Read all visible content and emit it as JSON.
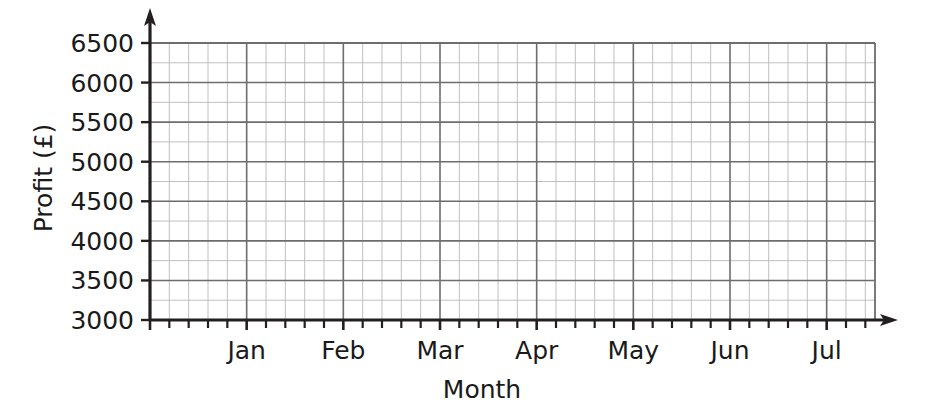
{
  "chart_data": {
    "type": "line",
    "title": "",
    "subtitle": "",
    "xlabel": "Month",
    "ylabel": "Profit (£)",
    "x_tick_labels": [
      "Jan",
      "Feb",
      "Mar",
      "Apr",
      "May",
      "Jun",
      "Jul"
    ],
    "y_tick_labels": [
      "3000",
      "3500",
      "4000",
      "4500",
      "5000",
      "5500",
      "6000",
      "6500"
    ],
    "y_tick_values": [
      3000,
      3500,
      4000,
      4500,
      5000,
      5500,
      6000,
      6500
    ],
    "ylim": [
      3000,
      6500
    ],
    "y_major_step": 500,
    "y_minor_step": 250,
    "x_minor_ticks_per_month": 5,
    "grid": true,
    "grid_minor": true,
    "legend": "none",
    "series": [],
    "values": [],
    "annotations": [],
    "note": "Empty plotting grid; no data series are drawn."
  },
  "axes": {
    "y_axis_label": "Profit (£)",
    "x_axis_label": "Month",
    "y_labels": [
      "6500",
      "6000",
      "5500",
      "5000",
      "4500",
      "4000",
      "3500",
      "3000"
    ],
    "x_labels": [
      "Jan",
      "Feb",
      "Mar",
      "Apr",
      "May",
      "Jun",
      "Jul"
    ]
  },
  "colors": {
    "background": "#ffffff",
    "axis": "#231f20",
    "grid_major": "#6d6d6d",
    "grid_minor": "#b9b9b9",
    "text": "#1a1a1a"
  },
  "icons": {
    "y_axis_arrow": "arrow-up-icon",
    "x_axis_arrow": "arrow-right-icon"
  }
}
